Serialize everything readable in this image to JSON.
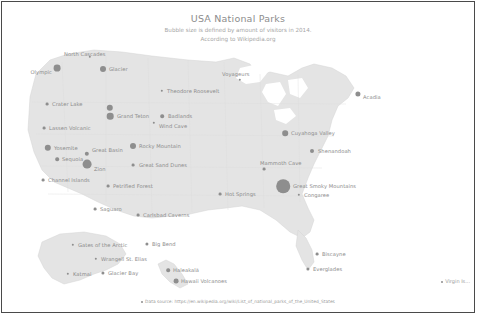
{
  "header": {
    "title": "USA National Parks",
    "subtitle1": "Bubble size is defined by amount of visitors in 2014.",
    "subtitle2": "According to Wikipedia.org"
  },
  "footer": {
    "source_label": "Data source: https://en.wikipedia.org/wiki/List_of_national_parks_of_the_United_States",
    "virgin_islands_label": "Virgin Is..."
  },
  "colors": {
    "bubble": "#8e8e8e",
    "land": "#e4e4e4",
    "land_stroke": "#d2d2d2",
    "text": "#8b8b8b",
    "title": "#8d8d8d",
    "frame": "#4a4a4a",
    "background": "#ffffff"
  },
  "chart_data": {
    "type": "scatter",
    "title": "USA National Parks",
    "subtitle": "Bubble size is defined by amount of visitors in 2014. According to Wikipedia.org",
    "xlabel": "",
    "ylabel": "",
    "size_encoding": "bubble area ∝ annual visitors (2014)",
    "points": [
      {
        "name": "North Cascades",
        "x": 88,
        "y": 55,
        "r": 1.2,
        "lx": 62,
        "ly": 52,
        "align": "left"
      },
      {
        "name": "Olympic",
        "x": 55,
        "y": 66,
        "r": 3.4,
        "lx": 50,
        "ly": 70,
        "align": "right"
      },
      {
        "name": "Glacier",
        "x": 101,
        "y": 67,
        "r": 3.0,
        "lx": 107,
        "ly": 67,
        "align": "left"
      },
      {
        "name": "Voyageurs",
        "x": 238,
        "y": 78,
        "r": 1.2,
        "lx": 220,
        "ly": 72,
        "align": "left"
      },
      {
        "name": "Acadia",
        "x": 356,
        "y": 92,
        "r": 2.6,
        "lx": 361,
        "ly": 95,
        "align": "left"
      },
      {
        "name": "Crater Lake",
        "x": 45,
        "y": 102,
        "r": 1.4,
        "lx": 50,
        "ly": 102,
        "align": "left"
      },
      {
        "name": "Theodore Roosevelt",
        "x": 160,
        "y": 89,
        "r": 1.2,
        "lx": 165,
        "ly": 89,
        "align": "left"
      },
      {
        "name": "Yellowstone",
        "x": 108,
        "y": 106,
        "r": 3.2,
        "lx": 0,
        "ly": 0,
        "align": "none"
      },
      {
        "name": "Grand Teton",
        "x": 108,
        "y": 114,
        "r": 3.3,
        "lx": 115,
        "ly": 114,
        "align": "left"
      },
      {
        "name": "Badlands",
        "x": 160,
        "y": 114,
        "r": 1.8,
        "lx": 166,
        "ly": 114,
        "align": "left"
      },
      {
        "name": "Wind Cave",
        "x": 152,
        "y": 121,
        "r": 1.2,
        "lx": 157,
        "ly": 124,
        "align": "left"
      },
      {
        "name": "Lassen Volcanic",
        "x": 42,
        "y": 126,
        "r": 1.4,
        "lx": 47,
        "ly": 126,
        "align": "left"
      },
      {
        "name": "Cuyahoga Valley",
        "x": 283,
        "y": 131,
        "r": 2.8,
        "lx": 289,
        "ly": 131,
        "align": "left"
      },
      {
        "name": "Rocky Mountain",
        "x": 131,
        "y": 144,
        "r": 3.0,
        "lx": 137,
        "ly": 144,
        "align": "left"
      },
      {
        "name": "Shenandoah",
        "x": 310,
        "y": 149,
        "r": 2.0,
        "lx": 316,
        "ly": 149,
        "align": "left"
      },
      {
        "name": "Yosemite",
        "x": 46,
        "y": 146,
        "r": 3.2,
        "lx": 52,
        "ly": 146,
        "align": "left"
      },
      {
        "name": "Great Basin",
        "x": 85,
        "y": 152,
        "r": 2.2,
        "lx": 90,
        "ly": 148,
        "align": "left"
      },
      {
        "name": "Great Sand Dunes",
        "x": 131,
        "y": 163,
        "r": 1.4,
        "lx": 137,
        "ly": 163,
        "align": "left"
      },
      {
        "name": "Mammoth Cave",
        "x": 262,
        "y": 167,
        "r": 1.4,
        "lx": 258,
        "ly": 161,
        "align": "left"
      },
      {
        "name": "Sequoia",
        "x": 55,
        "y": 157,
        "r": 1.8,
        "lx": 60,
        "ly": 157,
        "align": "left"
      },
      {
        "name": "Zion",
        "x": 85,
        "y": 162,
        "r": 4.4,
        "lx": 92,
        "ly": 167,
        "align": "left"
      },
      {
        "name": "Channel Islands",
        "x": 41,
        "y": 178,
        "r": 1.4,
        "lx": 46,
        "ly": 178,
        "align": "left"
      },
      {
        "name": "Petrified Forest",
        "x": 106,
        "y": 184,
        "r": 1.4,
        "lx": 111,
        "ly": 184,
        "align": "left"
      },
      {
        "name": "Hot Springs",
        "x": 218,
        "y": 192,
        "r": 1.4,
        "lx": 223,
        "ly": 192,
        "align": "left"
      },
      {
        "name": "Great Smoky Mountains",
        "x": 281,
        "y": 184,
        "r": 6.8,
        "lx": 291,
        "ly": 184,
        "align": "left"
      },
      {
        "name": "Congaree",
        "x": 297,
        "y": 193,
        "r": 1.2,
        "lx": 302,
        "ly": 193,
        "align": "left"
      },
      {
        "name": "Saguaro",
        "x": 93,
        "y": 207,
        "r": 1.4,
        "lx": 98,
        "ly": 207,
        "align": "left"
      },
      {
        "name": "Carlsbad Caverns",
        "x": 136,
        "y": 213,
        "r": 1.4,
        "lx": 141,
        "ly": 213,
        "align": "left"
      },
      {
        "name": "Gates of the Arctic",
        "x": 71,
        "y": 243,
        "r": 1.2,
        "lx": 76,
        "ly": 243,
        "align": "left"
      },
      {
        "name": "Big Bend",
        "x": 145,
        "y": 242,
        "r": 1.6,
        "lx": 150,
        "ly": 242,
        "align": "left"
      },
      {
        "name": "Biscayne",
        "x": 315,
        "y": 252,
        "r": 1.4,
        "lx": 320,
        "ly": 252,
        "align": "left"
      },
      {
        "name": "Wrangell St. Elias",
        "x": 94,
        "y": 257,
        "r": 1.2,
        "lx": 99,
        "ly": 257,
        "align": "left"
      },
      {
        "name": "Haleakalā",
        "x": 166,
        "y": 268,
        "r": 1.8,
        "lx": 171,
        "ly": 268,
        "align": "left"
      },
      {
        "name": "Katmai",
        "x": 66,
        "y": 272,
        "r": 1.2,
        "lx": 71,
        "ly": 272,
        "align": "left"
      },
      {
        "name": "Glacier Bay",
        "x": 101,
        "y": 271,
        "r": 1.6,
        "lx": 106,
        "ly": 271,
        "align": "left"
      },
      {
        "name": "Everglades",
        "x": 306,
        "y": 267,
        "r": 1.6,
        "lx": 311,
        "ly": 267,
        "align": "left"
      },
      {
        "name": "Hawaii Volcanoes",
        "x": 174,
        "y": 279,
        "r": 2.4,
        "lx": 179,
        "ly": 279,
        "align": "left"
      }
    ]
  }
}
